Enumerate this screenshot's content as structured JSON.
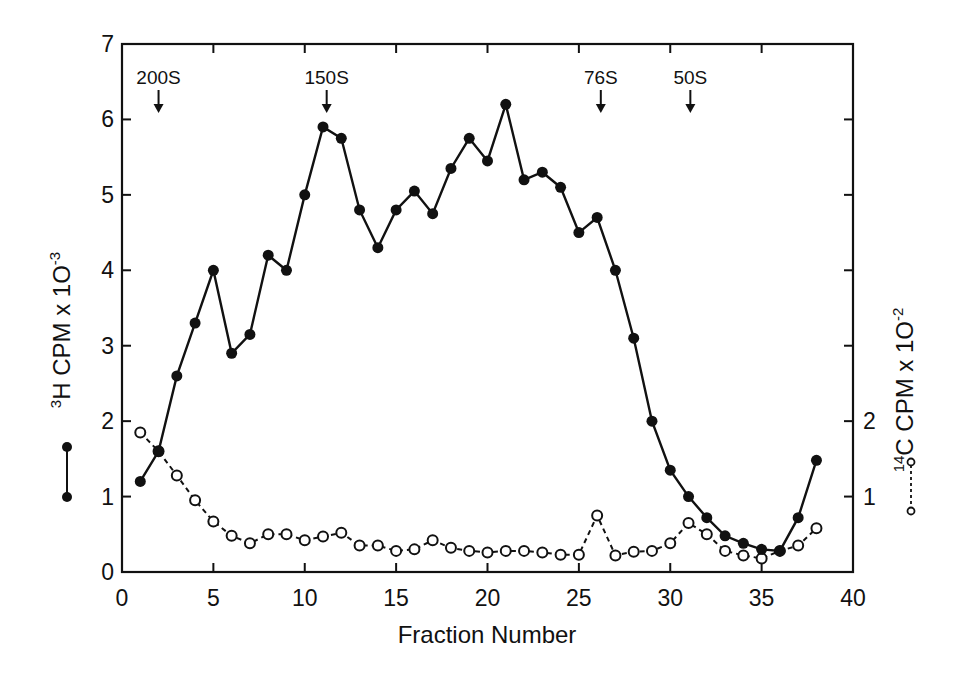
{
  "chart_data": {
    "type": "line",
    "title": "",
    "xlabel": "Fraction Number",
    "ylabel_left": "3H CPM x 10-3",
    "ylabel_left_parts": {
      "sup": "3",
      "main": "H  CPM x 1O",
      "exp": "-3"
    },
    "ylabel_right": "14C CPM x 10-2",
    "ylabel_right_parts": {
      "sup": "14",
      "main": "C  CPM x 1O",
      "exp": "-2"
    },
    "xlim": [
      0,
      40
    ],
    "ylim": [
      0,
      7
    ],
    "ylim_right": [
      0,
      7
    ],
    "x_ticks": [
      "0",
      "5",
      "10",
      "15",
      "20",
      "25",
      "30",
      "35",
      "40"
    ],
    "y_ticks_left": [
      "0",
      "1",
      "2",
      "3",
      "4",
      "5",
      "6",
      "7"
    ],
    "y_ticks_right_labeled": [
      "1",
      "2"
    ],
    "grid": false,
    "legend_position": "beside axes (left: filled-circle solid line; right: open-circle dashed line)",
    "annotations": [
      {
        "label": "200S",
        "x": 2
      },
      {
        "label": "150S",
        "x": 11.2
      },
      {
        "label": "76S",
        "x": 26.2
      },
      {
        "label": "50S",
        "x": 31.1
      }
    ],
    "x": [
      1,
      2,
      3,
      4,
      5,
      6,
      7,
      8,
      9,
      10,
      11,
      12,
      13,
      14,
      15,
      16,
      17,
      18,
      19,
      20,
      21,
      22,
      23,
      24,
      25,
      26,
      27,
      28,
      29,
      30,
      31,
      32,
      33,
      34,
      35,
      36,
      37,
      38
    ],
    "series": [
      {
        "name": "3H",
        "style": "solid line, filled circles",
        "axis": "left",
        "values": [
          1.2,
          1.6,
          2.6,
          3.3,
          4.0,
          2.9,
          3.15,
          4.2,
          4.0,
          5.0,
          5.9,
          5.75,
          4.8,
          4.3,
          4.8,
          5.05,
          4.75,
          5.35,
          5.75,
          5.45,
          6.2,
          5.2,
          5.3,
          5.1,
          4.5,
          4.7,
          4.0,
          3.1,
          2.0,
          1.35,
          1.0,
          0.72,
          0.48,
          0.38,
          0.3,
          0.28,
          0.72,
          1.48
        ]
      },
      {
        "name": "14C",
        "style": "dashed line, open circles",
        "axis": "right",
        "values": [
          1.85,
          1.6,
          1.28,
          0.95,
          0.67,
          0.48,
          0.38,
          0.5,
          0.5,
          0.42,
          0.47,
          0.52,
          0.35,
          0.35,
          0.28,
          0.3,
          0.42,
          0.32,
          0.28,
          0.26,
          0.28,
          0.28,
          0.26,
          0.23,
          0.23,
          0.75,
          0.22,
          0.27,
          0.28,
          0.38,
          0.65,
          0.5,
          0.28,
          0.22,
          0.18,
          0.28,
          0.35,
          0.58
        ]
      }
    ]
  },
  "labels": {
    "x_axis_title": "Fraction Number"
  }
}
